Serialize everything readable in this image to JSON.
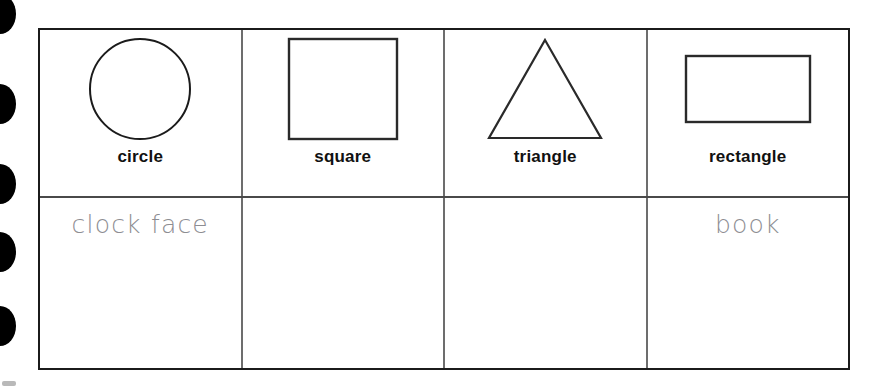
{
  "page": {
    "background_color": "#ffffff",
    "line_color": "#1b1b1b"
  },
  "binding": {
    "name": "spiral-binding-holes",
    "hole_count": 5,
    "hole_color": "#000000",
    "hole_centers_y": [
      14,
      104,
      184,
      252,
      326
    ]
  },
  "table": {
    "columns": 4,
    "rows": 2,
    "header_row_label": "shape row",
    "answer_row_label": "example row",
    "cells": [
      {
        "shape": "circle",
        "shape_icon": "circle-shape",
        "label": "circle",
        "answer": "clock face",
        "answer_filled": true
      },
      {
        "shape": "square",
        "shape_icon": "square-shape",
        "label": "square",
        "answer": "",
        "answer_filled": false
      },
      {
        "shape": "triangle",
        "shape_icon": "triangle-shape",
        "label": "triangle",
        "answer": "",
        "answer_filled": false
      },
      {
        "shape": "rectangle",
        "shape_icon": "rectangle-shape",
        "label": "rectangle",
        "answer": "book",
        "answer_filled": true
      }
    ]
  },
  "styles": {
    "label_color": "#111111",
    "answer_color": "#8d8d92",
    "shape_stroke": "#1b1b1b"
  }
}
